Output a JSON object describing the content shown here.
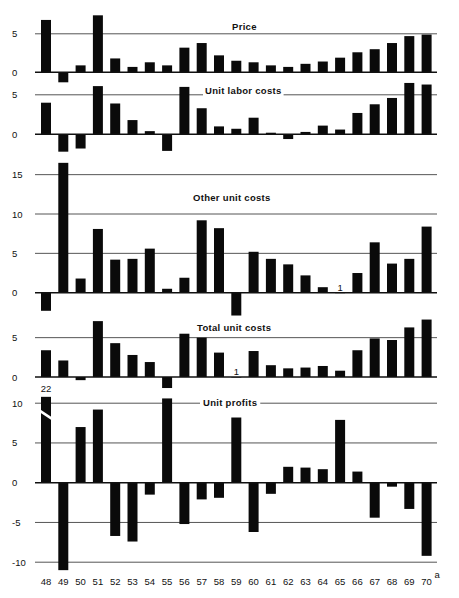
{
  "chart_data": [
    {
      "type": "bar",
      "title": "Price",
      "categories": [
        "48",
        "49",
        "50",
        "51",
        "52",
        "53",
        "54",
        "55",
        "56",
        "57",
        "58",
        "59",
        "60",
        "61",
        "62",
        "63",
        "64",
        "65",
        "66",
        "67",
        "68",
        "69",
        "70"
      ],
      "values": [
        6.8,
        -1.3,
        0.9,
        7.4,
        1.8,
        0.7,
        1.3,
        0.9,
        3.2,
        3.8,
        2.2,
        1.5,
        1.3,
        0.9,
        0.7,
        1.1,
        1.4,
        1.9,
        2.6,
        3.0,
        3.8,
        4.7,
        4.9
      ],
      "yticks": [
        0,
        5
      ],
      "ylim": [
        -1.5,
        8
      ],
      "grid": true
    },
    {
      "type": "bar",
      "title": "Unit labor costs",
      "categories": [
        "48",
        "49",
        "50",
        "51",
        "52",
        "53",
        "54",
        "55",
        "56",
        "57",
        "58",
        "59",
        "60",
        "61",
        "62",
        "63",
        "64",
        "65",
        "66",
        "67",
        "68",
        "69",
        "70"
      ],
      "values": [
        4.0,
        -2.2,
        -1.8,
        6.1,
        3.9,
        1.8,
        0.4,
        -2.1,
        6.0,
        3.3,
        1.0,
        0.7,
        2.1,
        0.2,
        -0.6,
        0.3,
        1.1,
        0.6,
        2.7,
        3.8,
        4.6,
        6.5,
        6.3
      ],
      "yticks": [
        0,
        5
      ],
      "ylim": [
        -2.5,
        7
      ],
      "grid": true
    },
    {
      "type": "bar",
      "title": "Other unit costs",
      "categories": [
        "48",
        "49",
        "50",
        "51",
        "52",
        "53",
        "54",
        "55",
        "56",
        "57",
        "58",
        "59",
        "60",
        "61",
        "62",
        "63",
        "64",
        "65",
        "66",
        "67",
        "68",
        "69",
        "70"
      ],
      "values": [
        -2.3,
        16.5,
        1.8,
        8.1,
        4.2,
        4.3,
        5.6,
        0.5,
        1.9,
        9.2,
        8.2,
        -2.9,
        5.2,
        4.3,
        3.6,
        2.2,
        0.7,
        0.0,
        2.5,
        6.4,
        3.7,
        4.3,
        8.4
      ],
      "annotations": [
        {
          "category": "65",
          "text": "1"
        }
      ],
      "yticks": [
        0,
        5,
        10,
        15
      ],
      "ylim": [
        -3,
        17
      ],
      "grid": true
    },
    {
      "type": "bar",
      "title": "Total unit costs",
      "categories": [
        "48",
        "49",
        "50",
        "51",
        "52",
        "53",
        "54",
        "55",
        "56",
        "57",
        "58",
        "59",
        "60",
        "61",
        "62",
        "63",
        "64",
        "65",
        "66",
        "67",
        "68",
        "69",
        "70"
      ],
      "values": [
        3.4,
        2.1,
        -0.4,
        7.1,
        4.3,
        2.8,
        1.9,
        -1.4,
        5.5,
        5.0,
        3.1,
        0.0,
        3.3,
        1.5,
        1.1,
        1.2,
        1.4,
        0.8,
        3.4,
        4.9,
        4.7,
        6.3,
        7.3
      ],
      "annotations": [
        {
          "category": "59",
          "text": "1"
        }
      ],
      "yticks": [
        0,
        5
      ],
      "ylim": [
        -1.5,
        7.5
      ],
      "grid": true
    },
    {
      "type": "bar",
      "title": "Unit profits",
      "categories": [
        "48",
        "49",
        "50",
        "51",
        "52",
        "53",
        "54",
        "55",
        "56",
        "57",
        "58",
        "59",
        "60",
        "61",
        "62",
        "63",
        "64",
        "65",
        "66",
        "67",
        "68",
        "69",
        "70"
      ],
      "values": [
        22,
        -11.0,
        7.0,
        9.2,
        -6.7,
        -7.4,
        -1.5,
        10.6,
        -5.2,
        -2.1,
        -1.9,
        8.2,
        -6.2,
        -1.4,
        2.0,
        1.9,
        1.7,
        7.9,
        1.4,
        -4.4,
        -0.5,
        -3.3,
        -9.2
      ],
      "annotations": [
        {
          "category": "48",
          "text": "22",
          "note": "bar broken (axis break)"
        }
      ],
      "yticks": [
        -10,
        -5,
        0,
        5,
        10
      ],
      "ylim": [
        -11,
        11
      ],
      "grid": true
    }
  ],
  "xaxis": {
    "labels": [
      "48",
      "49",
      "50",
      "51",
      "52",
      "53",
      "54",
      "55",
      "56",
      "57",
      "58",
      "59",
      "60",
      "61",
      "62",
      "63",
      "64",
      "65",
      "66",
      "67",
      "68",
      "69",
      "70"
    ],
    "last_label_footnote": "a"
  },
  "panels": {
    "price": {
      "title": "Price"
    },
    "labor": {
      "title": "Unit labor costs"
    },
    "other": {
      "title": "Other unit costs"
    },
    "total": {
      "title": "Total unit costs"
    },
    "profits": {
      "title": "Unit profits",
      "broken_label": "22"
    }
  },
  "colors": {
    "bar": "#0a0a0a",
    "grid": "#555555",
    "axis": "#111111"
  }
}
